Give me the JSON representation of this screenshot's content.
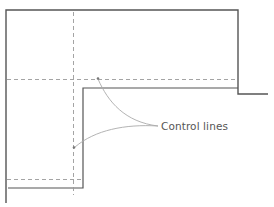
{
  "diagram": {
    "annotation": {
      "label": "Control lines",
      "color": "#555555"
    },
    "colors": {
      "outline": "#555555",
      "control_line": "#9a9a9a",
      "leader": "#aaaaaa",
      "background": "#ffffff"
    },
    "outline_path": [
      [
        6,
        203
      ],
      [
        6,
        10
      ],
      [
        238,
        10
      ],
      [
        238,
        94
      ],
      [
        268,
        94
      ]
    ],
    "inner_path": [
      [
        8,
        188
      ],
      [
        83,
        188
      ],
      [
        83,
        88
      ],
      [
        238,
        88
      ]
    ],
    "control_lines": {
      "vertical_x": 73,
      "horizontal_top_y": 79,
      "horizontal_bottom_y": 179
    },
    "leaders": [
      {
        "from": [
          158,
          126
        ],
        "to": [
          98,
          78
        ]
      },
      {
        "from": [
          158,
          126
        ],
        "to": [
          74,
          147
        ]
      }
    ]
  }
}
